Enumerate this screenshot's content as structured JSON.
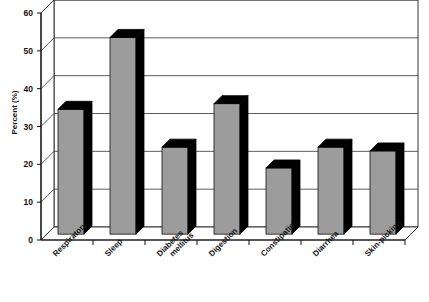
{
  "chart_data": {
    "type": "bar",
    "title": "",
    "xlabel": "",
    "ylabel": "Percent (%)",
    "ylim": [
      0,
      60
    ],
    "yticks": [
      0,
      10,
      20,
      30,
      40,
      50,
      60
    ],
    "grid": true,
    "legend": false,
    "style": "3d-column",
    "bar_color": "#9c9c9c",
    "bar_shade_color": "#000000",
    "categories": [
      "Respiratory",
      "Sleep",
      "Diabetes mellitus",
      "Digestion",
      "Constipation",
      "Diarrhea",
      "Skin-picking"
    ],
    "category_lines": [
      [
        "Respiratory"
      ],
      [
        "Sleep"
      ],
      [
        "Diabetes",
        "mellitus"
      ],
      [
        "Digestion"
      ],
      [
        "Constipation"
      ],
      [
        "Diarrhea"
      ],
      [
        "Skin-picking"
      ]
    ],
    "values": [
      33,
      52,
      23,
      34.5,
      17.5,
      23,
      22
    ]
  }
}
